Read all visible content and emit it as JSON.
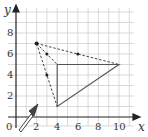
{
  "diagram": {
    "type": "coordinate-grid-enlargement",
    "axes": {
      "x_label": "x",
      "y_label": "y",
      "origin_label": "0",
      "x_ticks": [
        "2",
        "4",
        "6",
        "8",
        "10"
      ],
      "y_ticks": [
        "2",
        "4",
        "6",
        "8"
      ],
      "x_range": [
        0,
        11
      ],
      "y_range": [
        0,
        9
      ]
    },
    "triangle": {
      "vertices": [
        [
          4,
          5
        ],
        [
          10,
          5
        ],
        [
          4,
          1
        ]
      ],
      "style": "solid"
    },
    "center_of_enlargement": [
      2,
      7
    ],
    "rays": {
      "style": "dashed",
      "to": [
        [
          4,
          5
        ],
        [
          10,
          5
        ],
        [
          4,
          1
        ]
      ]
    },
    "midpoints": [
      [
        3,
        6
      ],
      [
        6,
        6
      ],
      [
        3,
        4
      ]
    ],
    "pointer": "arrow pointing at (2,1)",
    "colors": {
      "grid": "#cccccc",
      "axis": "#222222",
      "shape": "#555555",
      "arrow_fill": "#ffffff"
    }
  }
}
